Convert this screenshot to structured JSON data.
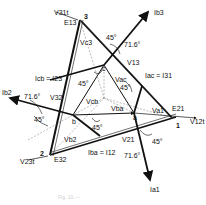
{
  "diagram": {
    "type": "phasor-diagram",
    "nodes": {
      "n1": "1",
      "n2": "2",
      "n3": "3",
      "a": "a",
      "b": "b",
      "c": "c"
    },
    "labels": {
      "v31t": "V31t",
      "e13": "E13",
      "vc3": "Vc3",
      "ib3": "Ib3",
      "v13": "V13",
      "icb": "Icb = I23",
      "iac": "Iac = I31",
      "vac": "Vac",
      "vcb": "Vcb",
      "v32": "V32",
      "ib2": "Ib2",
      "vba": "Vba",
      "vb2": "Vb2",
      "ibe": "Iba = I12",
      "v21": "V21",
      "va1": "Va1",
      "e21": "E21",
      "v12t": "V12t",
      "e32": "E32",
      "v23t": "V23t",
      "ia1": "Ia1"
    },
    "angles": {
      "a45_top": "45°",
      "a716_top": "71.6°",
      "a45_c": "45°",
      "a45_ac": "45°",
      "a716_left": "71.6°",
      "a45_left": "45°",
      "a45_bottom": "45°",
      "a45_right": "45°",
      "a716_bottom": "71.6°"
    },
    "caption": "Fig. 10.—"
  }
}
